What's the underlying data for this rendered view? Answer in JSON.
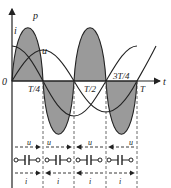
{
  "figure": {
    "type": "capacitor AC power waveform diagram",
    "axis": {
      "origin_label": "0",
      "x_label": "t"
    },
    "curve_labels": {
      "power": "p",
      "current": "i",
      "voltage": "u"
    },
    "ticks": [
      {
        "label": "T/4"
      },
      {
        "label": "T/2"
      },
      {
        "label": "3T/4"
      },
      {
        "label": "T"
      }
    ],
    "segments": [
      {
        "u_label": "u",
        "u_dir": "right",
        "i_label": "i",
        "i_dir": "right"
      },
      {
        "u_label": "u",
        "u_dir": "right",
        "i_label": "i",
        "i_dir": "left"
      },
      {
        "u_label": "u",
        "u_dir": "left",
        "i_label": "i",
        "i_dir": "left"
      },
      {
        "u_label": "u",
        "u_dir": "left",
        "i_label": "i",
        "i_dir": "right"
      }
    ],
    "colors": {
      "fill": "#9a9a9a",
      "line": "#222222",
      "background": "#ffffff"
    }
  }
}
